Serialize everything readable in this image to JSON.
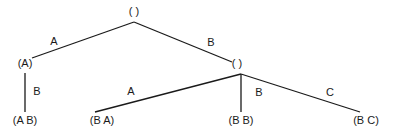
{
  "diagram": {
    "type": "tree",
    "nodes": [
      {
        "id": "root",
        "label": "( )",
        "x": 134,
        "y": 15
      },
      {
        "id": "A",
        "label": "(A)",
        "x": 25,
        "y": 67
      },
      {
        "id": "B",
        "label": "( )",
        "x": 237,
        "y": 67
      },
      {
        "id": "AB",
        "label": "(A B)",
        "x": 25,
        "y": 124
      },
      {
        "id": "BA",
        "label": "(B A)",
        "x": 102,
        "y": 124
      },
      {
        "id": "BB",
        "label": "(B B)",
        "x": 241,
        "y": 124
      },
      {
        "id": "BC",
        "label": "(B C)",
        "x": 366,
        "y": 124
      }
    ],
    "edges": [
      {
        "from": "root",
        "to": "A",
        "label": "A",
        "x1": 134,
        "y1": 22,
        "x2": 32,
        "y2": 58,
        "lx": 54,
        "ly": 45
      },
      {
        "from": "root",
        "to": "B",
        "label": "B",
        "x1": 134,
        "y1": 22,
        "x2": 232,
        "y2": 62,
        "lx": 211,
        "ly": 46
      },
      {
        "from": "A",
        "to": "AB",
        "label": "B",
        "x1": 25,
        "y1": 73,
        "x2": 25,
        "y2": 112,
        "lx": 37,
        "ly": 95
      },
      {
        "from": "B",
        "to": "BA",
        "label": "A",
        "x1": 241,
        "y1": 74,
        "x2": 95,
        "y2": 112,
        "lx": 131,
        "ly": 95
      },
      {
        "from": "B",
        "to": "BB",
        "label": "B",
        "x1": 241,
        "y1": 74,
        "x2": 241,
        "y2": 112,
        "lx": 259,
        "ly": 96
      },
      {
        "from": "B",
        "to": "BC",
        "label": "C",
        "x1": 241,
        "y1": 74,
        "x2": 360,
        "y2": 112,
        "lx": 330,
        "ly": 96
      }
    ]
  }
}
